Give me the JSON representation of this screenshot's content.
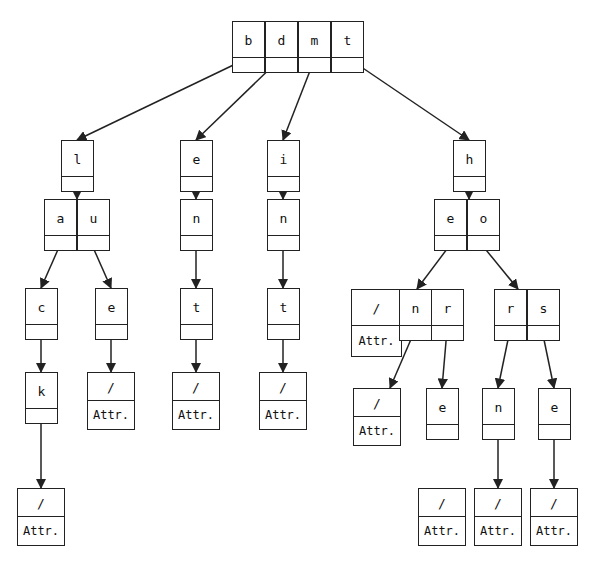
{
  "diagram": {
    "nodes": [
      {
        "id": "root",
        "x": 232,
        "y": 21,
        "keys": [
          "b",
          "d",
          "m",
          "t"
        ]
      },
      {
        "id": "l",
        "x": 61,
        "y": 140,
        "keys": [
          "l"
        ]
      },
      {
        "id": "au",
        "x": 44,
        "y": 199,
        "keys": [
          "a",
          "u"
        ]
      },
      {
        "id": "c",
        "x": 25,
        "y": 288,
        "keys": [
          "c"
        ]
      },
      {
        "id": "k",
        "x": 25,
        "y": 372,
        "keys": [
          "k"
        ]
      },
      {
        "id": "leaf-ck",
        "x": 17,
        "y": 488,
        "keys": [
          "/"
        ],
        "attr": "Attr."
      },
      {
        "id": "e-au",
        "x": 95,
        "y": 288,
        "keys": [
          "e"
        ]
      },
      {
        "id": "leaf-ue",
        "x": 87,
        "y": 372,
        "keys": [
          "/"
        ],
        "attr": "Attr."
      },
      {
        "id": "e",
        "x": 180,
        "y": 140,
        "keys": [
          "e"
        ]
      },
      {
        "id": "n-d",
        "x": 180,
        "y": 199,
        "keys": [
          "n"
        ]
      },
      {
        "id": "t-d",
        "x": 180,
        "y": 288,
        "keys": [
          "t"
        ]
      },
      {
        "id": "leaf-dent",
        "x": 172,
        "y": 372,
        "keys": [
          "/"
        ],
        "attr": "Attr."
      },
      {
        "id": "i",
        "x": 267,
        "y": 140,
        "keys": [
          "i"
        ]
      },
      {
        "id": "n-m",
        "x": 267,
        "y": 199,
        "keys": [
          "n"
        ]
      },
      {
        "id": "t-m",
        "x": 267,
        "y": 288,
        "keys": [
          "t"
        ]
      },
      {
        "id": "leaf-mint",
        "x": 259,
        "y": 372,
        "keys": [
          "/"
        ],
        "attr": "Attr."
      },
      {
        "id": "h",
        "x": 453,
        "y": 140,
        "keys": [
          "h"
        ]
      },
      {
        "id": "eo",
        "x": 434,
        "y": 199,
        "keys": [
          "e",
          "o"
        ]
      },
      {
        "id": "hen",
        "x": 351,
        "y": 289,
        "keys": [
          "/",
          "n",
          "r"
        ],
        "attr": "Attr."
      },
      {
        "id": "rs",
        "x": 494,
        "y": 289,
        "keys": [
          "r",
          "s"
        ]
      },
      {
        "id": "leaf-hen",
        "x": 353,
        "y": 388,
        "keys": [
          "/"
        ],
        "attr": "Attr."
      },
      {
        "id": "e-her",
        "x": 426,
        "y": 388,
        "keys": [
          "e"
        ]
      },
      {
        "id": "n-hor",
        "x": 482,
        "y": 388,
        "keys": [
          "n"
        ]
      },
      {
        "id": "e-hos",
        "x": 538,
        "y": 388,
        "keys": [
          "e"
        ]
      },
      {
        "id": "leaf-here",
        "x": 418,
        "y": 488,
        "keys": [
          "/"
        ],
        "attr": "Attr."
      },
      {
        "id": "leaf-horn",
        "x": 474,
        "y": 488,
        "keys": [
          "/"
        ],
        "attr": "Attr."
      },
      {
        "id": "leaf-hose",
        "x": 530,
        "y": 488,
        "keys": [
          "/"
        ],
        "attr": "Attr."
      }
    ],
    "edges": [
      {
        "from": [
          248,
          58
        ],
        "to": [
          77,
          140
        ]
      },
      {
        "from": [
          281,
          58
        ],
        "to": [
          196,
          140
        ]
      },
      {
        "from": [
          315,
          58
        ],
        "to": [
          283,
          140
        ]
      },
      {
        "from": [
          348,
          58
        ],
        "to": [
          469,
          140
        ]
      },
      {
        "from": [
          77,
          176
        ],
        "to": [
          77,
          199
        ]
      },
      {
        "from": [
          60,
          245
        ],
        "to": [
          41,
          288
        ]
      },
      {
        "from": [
          92,
          245
        ],
        "to": [
          111,
          288
        ]
      },
      {
        "from": [
          41,
          320
        ],
        "to": [
          41,
          372
        ]
      },
      {
        "from": [
          41,
          408
        ],
        "to": [
          41,
          488
        ]
      },
      {
        "from": [
          111,
          320
        ],
        "to": [
          111,
          372
        ]
      },
      {
        "from": [
          196,
          176
        ],
        "to": [
          196,
          199
        ]
      },
      {
        "from": [
          196,
          245
        ],
        "to": [
          196,
          288
        ]
      },
      {
        "from": [
          196,
          320
        ],
        "to": [
          196,
          372
        ]
      },
      {
        "from": [
          283,
          176
        ],
        "to": [
          283,
          199
        ]
      },
      {
        "from": [
          283,
          245
        ],
        "to": [
          283,
          288
        ]
      },
      {
        "from": [
          283,
          320
        ],
        "to": [
          283,
          372
        ]
      },
      {
        "from": [
          469,
          176
        ],
        "to": [
          469,
          199
        ]
      },
      {
        "from": [
          450,
          245
        ],
        "to": [
          417,
          289
        ]
      },
      {
        "from": [
          482,
          245
        ],
        "to": [
          518,
          289
        ]
      },
      {
        "from": [
          415,
          330
        ],
        "to": [
          390,
          388
        ]
      },
      {
        "from": [
          447,
          330
        ],
        "to": [
          442,
          388
        ]
      },
      {
        "from": [
          510,
          330
        ],
        "to": [
          498,
          388
        ]
      },
      {
        "from": [
          542,
          330
        ],
        "to": [
          554,
          388
        ]
      },
      {
        "from": [
          498,
          420
        ],
        "to": [
          498,
          488
        ]
      },
      {
        "from": [
          554,
          420
        ],
        "to": [
          554,
          488
        ]
      }
    ],
    "cell_width": 32,
    "cell_height": 36,
    "ptr_height": 14,
    "leaf_width": 48,
    "leaf_height": 28,
    "line_color": "#222222"
  }
}
